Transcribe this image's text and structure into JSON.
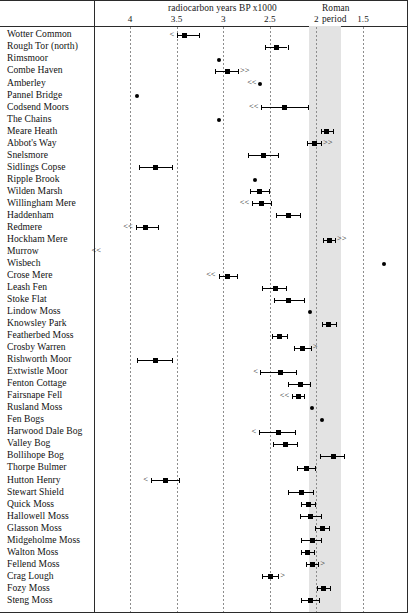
{
  "figure": {
    "axis_title": "radiocarbon years BP x1000",
    "band_label_line1": "Roman",
    "band_label_line2": "period",
    "tick_labels": [
      "4",
      "3.5",
      "3",
      "2.5",
      "2",
      "1.5"
    ],
    "tick_values": [
      4,
      3.5,
      3,
      2.5,
      2,
      1.5
    ]
  },
  "chart_data": {
    "type": "scatter",
    "title": "radiocarbon years BP x1000",
    "xlabel": "radiocarbon years BP x1000",
    "ylabel": "",
    "xlim": [
      4.3,
      1.25
    ],
    "x_inverted": true,
    "xticks": [
      4,
      3.5,
      3,
      2.5,
      2,
      1.5
    ],
    "grid": true,
    "legend": null,
    "annotations": [
      {
        "text": "Roman period",
        "x_range": [
          2.08,
          1.74
        ],
        "type": "shaded-band"
      }
    ],
    "note": "x decreases left to right; '<' / '<<' mean older-limit arrows, '>' / '>>' mean younger-limit arrows",
    "categories": [
      "Wotter Common",
      "Rough Tor (north)",
      "Rimsmoor",
      "Combe Haven",
      "Amberley",
      "Pannel Bridge",
      "Codsend Moors",
      "The Chains",
      "Meare Heath",
      "Abbot's Way",
      "Snelsmore",
      "Sidlings Copse",
      "Ripple Brook",
      "Wilden Marsh",
      "Willingham Mere",
      "Haddenham",
      "Redmere",
      "Hockham Mere",
      "Murrow",
      "Wisbech",
      "Crose Mere",
      "Leash Fen",
      "Stoke Flat",
      "Lindow Moss",
      "Knowsley Park",
      "Featherbed Moss",
      "Crosby Warren",
      "Rishworth Moor",
      "Extwistle Moor",
      "Fenton Cottage",
      "Fairsnape Fell",
      "Rusland Moss",
      "Fen Bogs",
      "Harwood Dale Bog",
      "Valley Bog",
      "Bollihope Bog",
      "Thorpe Bulmer",
      "Hutton Henry",
      "Stewart Shield",
      "Quick Moss",
      "Hallowell Moss",
      "Glasson Moss",
      "Midgeholme Moss",
      "Walton Moss",
      "Fellend Moss",
      "Crag Lough",
      "Fozy Moss",
      "Steng Moss"
    ],
    "points": [
      {
        "site": "Wotter Common",
        "value": 3.42,
        "low": 3.5,
        "high": 3.26,
        "left_arrow": "<",
        "right_arrow": ""
      },
      {
        "site": "Rough Tor (north)",
        "value": 2.43,
        "low": 2.55,
        "high": 2.31,
        "left_arrow": "",
        "right_arrow": ""
      },
      {
        "site": "Rimsmoor",
        "value": 3.05,
        "low": null,
        "high": null,
        "left_arrow": "",
        "right_arrow": ""
      },
      {
        "site": "Combe Haven",
        "value": 2.95,
        "low": 3.09,
        "high": 2.84,
        "left_arrow": "",
        "right_arrow": ">>"
      },
      {
        "site": "Amberley",
        "value": 2.61,
        "low": null,
        "high": null,
        "left_arrow": "<<",
        "right_arrow": ""
      },
      {
        "site": "Pannel Bridge",
        "value": 3.92,
        "low": null,
        "high": null,
        "left_arrow": "",
        "right_arrow": ""
      },
      {
        "site": "Codsend Moors",
        "value": 2.34,
        "low": 2.59,
        "high": 2.09,
        "left_arrow": "<<",
        "right_arrow": ""
      },
      {
        "site": "The Chains",
        "value": 3.04,
        "low": null,
        "high": null,
        "left_arrow": "",
        "right_arrow": ""
      },
      {
        "site": "Meare Heath",
        "value": 1.89,
        "low": 1.95,
        "high": 1.82,
        "left_arrow": "",
        "right_arrow": ""
      },
      {
        "site": "Abbot's Way",
        "value": 2.02,
        "low": 2.1,
        "high": 1.95,
        "left_arrow": "",
        "right_arrow": ">>"
      },
      {
        "site": "Snelsmore",
        "value": 2.57,
        "low": 2.73,
        "high": 2.41,
        "left_arrow": "",
        "right_arrow": ""
      },
      {
        "site": "Sidlings Copse",
        "value": 3.73,
        "low": 3.9,
        "high": 3.55,
        "left_arrow": "",
        "right_arrow": ""
      },
      {
        "site": "Ripple Brook",
        "value": 2.66,
        "low": null,
        "high": null,
        "left_arrow": "",
        "right_arrow": ""
      },
      {
        "site": "Wilden Marsh",
        "value": 2.61,
        "low": 2.71,
        "high": 2.51,
        "left_arrow": "",
        "right_arrow": ""
      },
      {
        "site": "Willingham Mere",
        "value": 2.59,
        "low": 2.69,
        "high": 2.49,
        "left_arrow": "<<",
        "right_arrow": ""
      },
      {
        "site": "Haddenham",
        "value": 2.3,
        "low": 2.43,
        "high": 2.18,
        "left_arrow": "",
        "right_arrow": ""
      },
      {
        "site": "Redmere",
        "value": 3.83,
        "low": 3.94,
        "high": 3.7,
        "left_arrow": "<<",
        "right_arrow": ""
      },
      {
        "site": "Hockham Mere",
        "value": 1.86,
        "low": 1.93,
        "high": 1.8,
        "left_arrow": "",
        "right_arrow": ">>"
      },
      {
        "site": "Murrow",
        "value": null,
        "low": null,
        "high": null,
        "left_arrow": "<<",
        "right_arrow": ""
      },
      {
        "site": "Wisbech",
        "value": 1.28,
        "low": null,
        "high": null,
        "left_arrow": "",
        "right_arrow": ""
      },
      {
        "site": "Crose Mere",
        "value": 2.95,
        "low": 3.05,
        "high": 2.85,
        "left_arrow": "<<",
        "right_arrow": ""
      },
      {
        "site": "Leash Fen",
        "value": 2.44,
        "low": 2.58,
        "high": 2.33,
        "left_arrow": "",
        "right_arrow": ""
      },
      {
        "site": "Stoke Flat",
        "value": 2.3,
        "low": 2.45,
        "high": 2.13,
        "left_arrow": "",
        "right_arrow": ""
      },
      {
        "site": "Lindow Moss",
        "value": 2.07,
        "low": null,
        "high": null,
        "left_arrow": "",
        "right_arrow": ""
      },
      {
        "site": "Knowsley Park",
        "value": 1.87,
        "low": 1.94,
        "high": 1.79,
        "left_arrow": "",
        "right_arrow": ""
      },
      {
        "site": "Featherbed Moss",
        "value": 2.4,
        "low": 2.48,
        "high": 2.32,
        "left_arrow": "",
        "right_arrow": ""
      },
      {
        "site": "Crosby Warren",
        "value": 2.15,
        "low": 2.24,
        "high": 2.06,
        "left_arrow": "",
        "right_arrow": ">"
      },
      {
        "site": "Rishworth Moor",
        "value": 3.73,
        "low": 3.92,
        "high": 3.55,
        "left_arrow": "",
        "right_arrow": ""
      },
      {
        "site": "Extwistle Moor",
        "value": 2.39,
        "low": 2.6,
        "high": 2.22,
        "left_arrow": "<",
        "right_arrow": ""
      },
      {
        "site": "Fenton Cottage",
        "value": 2.17,
        "low": 2.31,
        "high": 2.07,
        "left_arrow": "",
        "right_arrow": ""
      },
      {
        "site": "Fairsnape Fell",
        "value": 2.19,
        "low": 2.26,
        "high": 2.13,
        "left_arrow": "<<",
        "right_arrow": ""
      },
      {
        "site": "Rusland Moss",
        "value": 2.05,
        "low": null,
        "high": null,
        "left_arrow": "",
        "right_arrow": ""
      },
      {
        "site": "Fen Bogs",
        "value": 1.94,
        "low": null,
        "high": null,
        "left_arrow": "",
        "right_arrow": ""
      },
      {
        "site": "Harwood Dale Bog",
        "value": 2.41,
        "low": 2.62,
        "high": 2.23,
        "left_arrow": "<",
        "right_arrow": ""
      },
      {
        "site": "Valley Bog",
        "value": 2.33,
        "low": 2.47,
        "high": 2.21,
        "left_arrow": "",
        "right_arrow": ""
      },
      {
        "site": "Bollihope Bog",
        "value": 1.82,
        "low": 1.96,
        "high": 1.7,
        "left_arrow": "",
        "right_arrow": ""
      },
      {
        "site": "Thorpe Bulmer",
        "value": 2.11,
        "low": 2.21,
        "high": 2.02,
        "left_arrow": "",
        "right_arrow": ""
      },
      {
        "site": "Hutton Henry",
        "value": 3.62,
        "low": 3.78,
        "high": 3.47,
        "left_arrow": "<",
        "right_arrow": ""
      },
      {
        "site": "Stewart Shield",
        "value": 2.16,
        "low": 2.3,
        "high": 2.04,
        "left_arrow": "",
        "right_arrow": ""
      },
      {
        "site": "Quick Moss",
        "value": 2.09,
        "low": 2.17,
        "high": 2.01,
        "left_arrow": "",
        "right_arrow": ""
      },
      {
        "site": "Hallowell Moss",
        "value": 2.06,
        "low": 2.18,
        "high": 1.95,
        "left_arrow": "",
        "right_arrow": ""
      },
      {
        "site": "Glasson Moss",
        "value": 1.93,
        "low": 2.01,
        "high": 1.86,
        "left_arrow": "",
        "right_arrow": ""
      },
      {
        "site": "Midgeholme Moss",
        "value": 2.04,
        "low": 2.16,
        "high": 1.95,
        "left_arrow": "",
        "right_arrow": ""
      },
      {
        "site": "Walton Moss",
        "value": 2.1,
        "low": 2.17,
        "high": 2.03,
        "left_arrow": "",
        "right_arrow": ""
      },
      {
        "site": "Fellend Moss",
        "value": 2.04,
        "low": 2.11,
        "high": 1.98,
        "left_arrow": "",
        "right_arrow": ">"
      },
      {
        "site": "Crag Lough",
        "value": 2.49,
        "low": 2.58,
        "high": 2.41,
        "left_arrow": "",
        "right_arrow": ">"
      },
      {
        "site": "Fozy Moss",
        "value": 1.92,
        "low": 1.99,
        "high": 1.85,
        "left_arrow": "",
        "right_arrow": ""
      },
      {
        "site": "Steng Moss",
        "value": 2.06,
        "low": 2.17,
        "high": 1.97,
        "left_arrow": "",
        "right_arrow": ""
      }
    ]
  }
}
